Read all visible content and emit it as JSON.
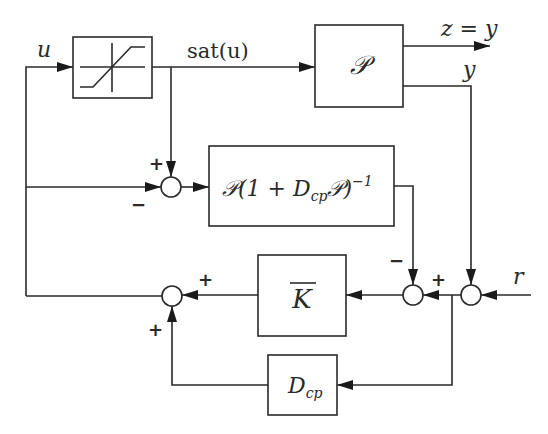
{
  "diagram": {
    "type": "block-diagram",
    "blocks": {
      "saturation": {
        "label": "",
        "icon": "saturation-nonlinearity"
      },
      "plant": {
        "label": "𝒫"
      },
      "model": {
        "label_main": "𝒫(1 + D",
        "label_sub": "cp",
        "label_end": "𝒫)",
        "label_sup": "−1"
      },
      "controller": {
        "label": "K",
        "overbar": true
      },
      "dcp": {
        "label_main": "D",
        "label_sub": "cp"
      }
    },
    "signals": {
      "u": "u",
      "sat_u": "sat(u)",
      "z_eq_y": "z = y",
      "y": "y",
      "r": "r"
    },
    "signs": {
      "sum1_top": "+",
      "sum1_left": "−",
      "sum2_top": "−",
      "sum2_right": "+",
      "sum4_right": "+",
      "sum4_bottom": "+"
    },
    "colors": {
      "line": "#2a2a2a",
      "background": "#ffffff"
    }
  }
}
